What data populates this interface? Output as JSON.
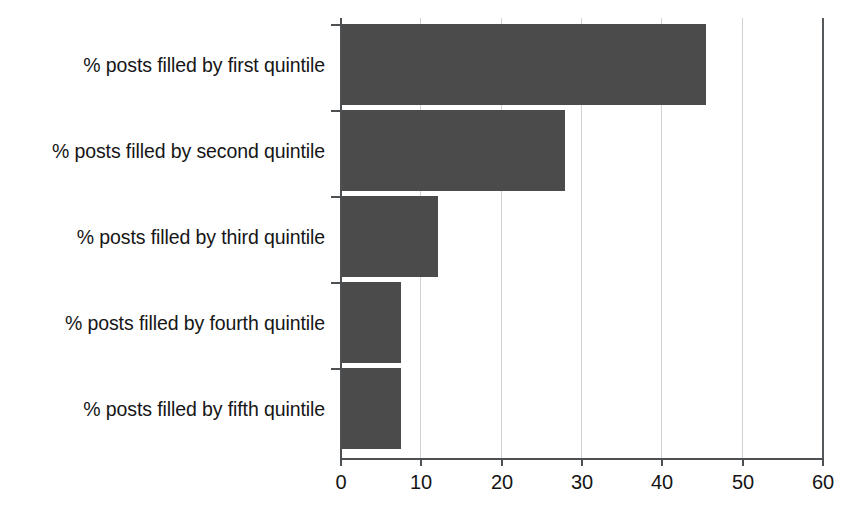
{
  "chart_data": {
    "type": "bar",
    "orientation": "horizontal",
    "title": "",
    "subtitle": "",
    "xlabel": "",
    "ylabel": "",
    "categories": [
      "% posts filled by first quintile",
      "% posts filled by second quintile",
      "% posts filled by third quintile",
      "% posts filled by fourth quintile",
      "% posts filled by fifth quintile"
    ],
    "values": [
      45.6,
      28.0,
      12.2,
      7.6,
      7.6
    ],
    "xlim": [
      0,
      60
    ],
    "xticks": [
      0,
      10,
      20,
      30,
      40,
      50,
      60
    ],
    "xtick_labels": [
      "0",
      "10",
      "20",
      "30",
      "40",
      "50",
      "60"
    ],
    "grid": "vertical",
    "legend": "none",
    "bar_color": "#4b4b4b",
    "axis_color": "#4d5053",
    "gridline_color": "#d2d2d2",
    "background": "#ffffff"
  }
}
